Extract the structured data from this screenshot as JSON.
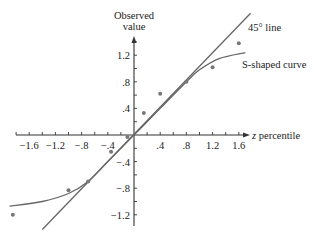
{
  "chart_data": {
    "type": "scatter",
    "title": "",
    "xlabel": "z percentile",
    "ylabel": "Observed value",
    "xlim": [
      -1.9,
      1.75
    ],
    "ylim": [
      -1.35,
      1.45
    ],
    "grid": false,
    "x_ticks": [
      "-1.6",
      "-1.2",
      "-.8",
      "-.4",
      ".4",
      ".8",
      "1.2",
      "1.6"
    ],
    "y_ticks": [
      "1.2",
      ".8",
      ".4",
      "-.4",
      "-.8",
      "-1.2"
    ],
    "series": [
      {
        "name": "observations",
        "type": "scatter",
        "points": [
          {
            "x": -1.85,
            "y": -1.2
          },
          {
            "x": -1.0,
            "y": -0.83
          },
          {
            "x": -0.7,
            "y": -0.7
          },
          {
            "x": -0.35,
            "y": -0.25
          },
          {
            "x": -0.1,
            "y": -0.03
          },
          {
            "x": 0.15,
            "y": 0.33
          },
          {
            "x": 0.4,
            "y": 0.62
          },
          {
            "x": 0.8,
            "y": 0.8
          },
          {
            "x": 1.2,
            "y": 1.02
          },
          {
            "x": 1.6,
            "y": 1.38
          }
        ]
      },
      {
        "name": "45° line",
        "type": "line",
        "points": [
          {
            "x": -1.4,
            "y": -1.42
          },
          {
            "x": 1.78,
            "y": 1.83
          }
        ]
      },
      {
        "name": "S-shaped curve",
        "type": "line",
        "points": [
          {
            "x": -1.9,
            "y": -1.07
          },
          {
            "x": -1.4,
            "y": -1.0
          },
          {
            "x": -1.0,
            "y": -0.88
          },
          {
            "x": -0.7,
            "y": -0.7
          },
          {
            "x": -0.4,
            "y": -0.4
          },
          {
            "x": 0.0,
            "y": 0.0
          },
          {
            "x": 0.4,
            "y": 0.4
          },
          {
            "x": 0.8,
            "y": 0.8
          },
          {
            "x": 1.0,
            "y": 0.98
          },
          {
            "x": 1.3,
            "y": 1.15
          },
          {
            "x": 1.7,
            "y": 1.24
          }
        ]
      }
    ],
    "annotations": [
      {
        "text": "45° line",
        "target": "45° line"
      },
      {
        "text": "S-shaped curve",
        "target": "S-shaped curve"
      }
    ]
  },
  "labels": {
    "y_axis_line1": "Observed",
    "y_axis_line2": "value",
    "x_axis_prefix": "z",
    "x_axis_suffix": " percentile",
    "line45": "45° line",
    "scurve": "S-shaped curve"
  },
  "colors": {
    "axis": "#333333",
    "line": "#666666",
    "points": "#777777",
    "text": "#222222"
  }
}
